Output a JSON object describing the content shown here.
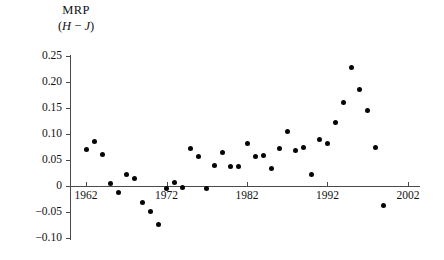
{
  "chart_data": {
    "type": "scatter",
    "title": "MRP",
    "subtitle_prefix": "(",
    "subtitle_var1": "H",
    "subtitle_minus": " − ",
    "subtitle_var2": "J",
    "subtitle_suffix": ")",
    "subtitle_plain": "(H − J)",
    "xlabel": "",
    "ylabel": "MRP (H − J)",
    "xlim": [
      1960,
      2003.5
    ],
    "ylim": [
      -0.115,
      0.265
    ],
    "grid": false,
    "legend": null,
    "x_ticks": [
      1962,
      1972,
      1982,
      1992,
      2002
    ],
    "x_tick_labels": [
      "1962",
      "1972",
      "1982",
      "1992",
      "2002"
    ],
    "y_ticks": [
      0.25,
      0.2,
      0.15,
      0.1,
      0.05,
      0,
      -0.05,
      -0.1
    ],
    "y_tick_labels": [
      "0.25",
      "0.20",
      "0.15",
      "0.10",
      "0.05",
      "0",
      "−0.05",
      "−0.10"
    ],
    "marker": "filled-circle",
    "marker_color": "#050505",
    "axis_color": "#4a4a4a",
    "points": [
      {
        "x": 1962.0,
        "y": 0.071
      },
      {
        "x": 1963.0,
        "y": 0.086
      },
      {
        "x": 1964.0,
        "y": 0.06
      },
      {
        "x": 1965.0,
        "y": 0.005
      },
      {
        "x": 1966.0,
        "y": -0.012
      },
      {
        "x": 1967.0,
        "y": 0.022
      },
      {
        "x": 1968.0,
        "y": 0.014
      },
      {
        "x": 1969.0,
        "y": -0.032
      },
      {
        "x": 1970.0,
        "y": -0.049
      },
      {
        "x": 1971.0,
        "y": -0.074
      },
      {
        "x": 1972.0,
        "y": -0.005
      },
      {
        "x": 1973.0,
        "y": 0.006
      },
      {
        "x": 1974.0,
        "y": -0.003
      },
      {
        "x": 1975.0,
        "y": 0.072
      },
      {
        "x": 1976.0,
        "y": 0.057
      },
      {
        "x": 1977.0,
        "y": -0.005
      },
      {
        "x": 1978.0,
        "y": 0.039
      },
      {
        "x": 1979.0,
        "y": 0.065
      },
      {
        "x": 1980.0,
        "y": 0.038
      },
      {
        "x": 1981.0,
        "y": 0.038
      },
      {
        "x": 1982.0,
        "y": 0.081
      },
      {
        "x": 1983.0,
        "y": 0.057
      },
      {
        "x": 1984.0,
        "y": 0.059
      },
      {
        "x": 1985.0,
        "y": 0.034
      },
      {
        "x": 1986.0,
        "y": 0.072
      },
      {
        "x": 1987.0,
        "y": 0.104
      },
      {
        "x": 1988.0,
        "y": 0.068
      },
      {
        "x": 1989.0,
        "y": 0.074
      },
      {
        "x": 1990.0,
        "y": 0.022
      },
      {
        "x": 1991.0,
        "y": 0.09
      },
      {
        "x": 1992.0,
        "y": 0.082
      },
      {
        "x": 1993.0,
        "y": 0.122
      },
      {
        "x": 1994.0,
        "y": 0.16
      },
      {
        "x": 1995.0,
        "y": 0.228
      },
      {
        "x": 1996.0,
        "y": 0.185
      },
      {
        "x": 1997.0,
        "y": 0.145
      },
      {
        "x": 1998.0,
        "y": 0.074
      },
      {
        "x": 1999.0,
        "y": -0.037
      }
    ]
  }
}
